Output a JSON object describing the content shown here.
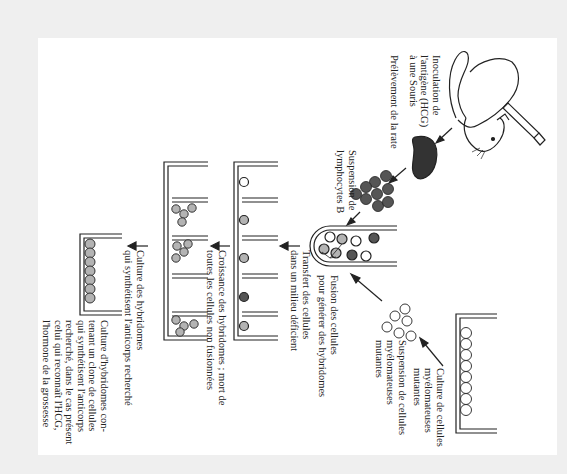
{
  "diagram": {
    "orientation": "rotated-90-clockwise",
    "colors": {
      "frame": "#efefef",
      "page": "#ffffff",
      "ink": "#222222",
      "lymphocyte": "#555555",
      "hybridoma": "#b3b3b3",
      "myeloma": "#ffffff"
    },
    "steps": [
      {
        "id": "inoculation",
        "label": "Inoculation de\nl'antigène (HCG)\nà une Souris"
      },
      {
        "id": "spleen",
        "label": "Prélèvement de la rate"
      },
      {
        "id": "lymphocytes",
        "label": "Suspension de\nlymphocytes B"
      },
      {
        "id": "myeloma-culture",
        "label": "Culture de cellules\nmyélomateuses\nmutantes"
      },
      {
        "id": "myeloma-suspension",
        "label": "Suspension de cellules\nmyélomateuses\nmutantes"
      },
      {
        "id": "fusion",
        "label": "Fusion des cellules\npour générer des hybridomes"
      },
      {
        "id": "transfer",
        "label": "Transfert des cellules\ndans un milieu déficient"
      },
      {
        "id": "growth",
        "label": "Croissance des hybridomes ; mort de\ntoutes les cellules non fusionnées"
      },
      {
        "id": "antibody-culture",
        "label": "Culture des hybridomes\nqui synthétisent l'anticorps recherché"
      },
      {
        "id": "clone-culture",
        "label": "Culture d'hybridomes con-\ntenant un clone de cellules\nqui synthétisent l'anticorps\nrecherché, dans le cas présent\ncelui qui reconnaît l'HCG,\nl'hormone de la grossesse"
      }
    ],
    "labels": {
      "inoculation": "Inoculation de\nl'antigène (HCG)\nà une Souris",
      "spleen": "Prélèvement de la rate",
      "lymphocytes": "Suspension de\nlymphocytes B",
      "myeloma_culture": "Culture de cellules\nmyélomateuses\nmutantes",
      "myeloma_suspension": "Suspension de cellules\nmyélomateuses\nmutantes",
      "fusion": "Fusion des cellules\npour générer des hybridomes",
      "transfer": "Transfert des cellules\ndans un milieu déficient",
      "growth": "Croissance des hybridomes ; mort de\ntoutes les cellules non fusionnées",
      "antibody_culture": "Culture des hybridomes\nqui synthétisent l'anticorps recherché",
      "clone_culture": "Culture d'hybridomes con-\ntenant un clone de cellules\nqui synthétisent l'anticorps\nrecherché, dans le cas présent\ncelui qui reconnaît l'HCG,\nl'hormone de la grossesse"
    }
  }
}
